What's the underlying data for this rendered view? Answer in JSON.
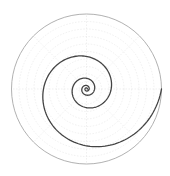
{
  "chart_data": {
    "type": "polar-line",
    "title": "",
    "series": [
      {
        "name": "log spiral",
        "equation": "r = r_max * exp(k * t), t = clockwise angle from 0 rad",
        "r_max": 75,
        "k": -0.177,
        "turns": 4,
        "sample_points": [
          {
            "theta_deg": 0,
            "r": 75
          },
          {
            "theta_deg": -90,
            "r": 56
          },
          {
            "theta_deg": -180,
            "r": 45
          },
          {
            "theta_deg": -270,
            "r": 33
          },
          {
            "theta_deg": -540,
            "r": 14
          }
        ],
        "color": "#444444"
      }
    ],
    "rlim": [
      0,
      75
    ],
    "grid": true,
    "grid_rings": 10,
    "grid_spokes_deg": [
      0,
      45,
      90,
      135,
      180,
      225,
      270,
      315
    ],
    "tick_labels_visible": false,
    "legend": null
  },
  "layout": {
    "center_x": 86.5,
    "center_y": 89,
    "outer_radius": 75,
    "grid_color": "#e6e6e6",
    "frame_color": "#a8a8a8"
  }
}
